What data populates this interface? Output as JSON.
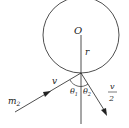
{
  "diagram": {
    "center_label": "O",
    "radius_label": "r",
    "incoming_velocity_label": "v",
    "mass_label": "m",
    "mass_subscript": "2",
    "angle1_label": "θ",
    "angle1_subscript": "1",
    "angle2_label": "θ",
    "angle2_subscript": "2",
    "outgoing_velocity_numerator": "v",
    "outgoing_velocity_denominator": "2",
    "stroke_color": "#222222"
  }
}
